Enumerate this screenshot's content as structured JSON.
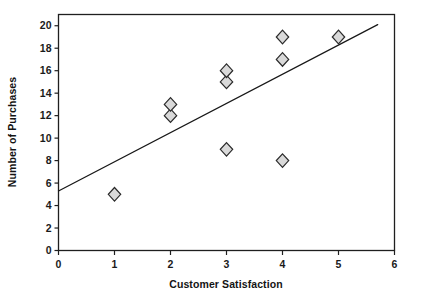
{
  "chart_data": {
    "type": "scatter",
    "title": "",
    "xlabel": "Customer Satisfaction",
    "ylabel": "Number of Purchases",
    "xlim": [
      0,
      6
    ],
    "ylim": [
      0,
      21
    ],
    "xticks": [
      0,
      1,
      2,
      3,
      4,
      5,
      6
    ],
    "yticks": [
      0,
      2,
      4,
      6,
      8,
      10,
      12,
      14,
      16,
      18,
      20
    ],
    "xtick_labels": [
      "0",
      "1",
      "2",
      "3",
      "4",
      "5",
      "6"
    ],
    "ytick_labels": [
      "0",
      "2",
      "4",
      "6",
      "8",
      "10",
      "12",
      "14",
      "16",
      "18",
      "20"
    ],
    "grid": false,
    "legend": null,
    "marker_shape": "diamond",
    "marker_fill": "#d9d9d9",
    "marker_edge": "#2a2a2a",
    "series": [
      {
        "name": "Observations",
        "points": [
          {
            "x": 1,
            "y": 5
          },
          {
            "x": 2,
            "y": 12
          },
          {
            "x": 2,
            "y": 13
          },
          {
            "x": 3,
            "y": 9
          },
          {
            "x": 3,
            "y": 15
          },
          {
            "x": 3,
            "y": 16
          },
          {
            "x": 4,
            "y": 8
          },
          {
            "x": 4,
            "y": 17
          },
          {
            "x": 4,
            "y": 19
          },
          {
            "x": 5,
            "y": 19
          }
        ]
      }
    ],
    "trendline": {
      "type": "line",
      "x": [
        0,
        5.7
      ],
      "y": [
        5.3,
        20.1
      ],
      "color": "#181818"
    }
  }
}
